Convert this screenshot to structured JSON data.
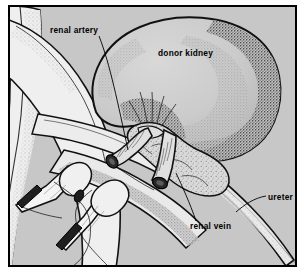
{
  "figure": {
    "kind": "medical-illustration",
    "frame": {
      "border_color": "#000000",
      "background_color": "#c7c7c7",
      "margin_color": "#ffffff"
    },
    "palette": {
      "background": "#c7c7c7",
      "organ_fill": "#cfcfcf",
      "vessel_fill": "#eeeeee",
      "tissue_fill": "#dcdcdc",
      "outline": "#111111",
      "lumen_dark": "#2b2b2b",
      "stipple": "#4a4a4a",
      "label_text": "#000000"
    }
  },
  "labels": [
    {
      "id": "renal-artery",
      "text": "renal artery",
      "x": 50,
      "y": 33,
      "anchor": "start",
      "leader": "M 99,36 C 110,64 118,104 128,150"
    },
    {
      "id": "donor-kidney",
      "text": "donor kidney",
      "x": 158,
      "y": 56,
      "anchor": "start",
      "leader": ""
    },
    {
      "id": "ureter",
      "text": "ureter",
      "x": 268,
      "y": 200,
      "anchor": "start",
      "leader": "M 266,196 C 254,198 244,205 236,212"
    },
    {
      "id": "renal-vein",
      "text": "renal vein",
      "x": 190,
      "y": 229,
      "anchor": "start",
      "leader": "M 196,221 C 190,203 182,186 176,173"
    }
  ],
  "structures": [
    {
      "id": "donor-kidney",
      "name": "donor kidney"
    },
    {
      "id": "renal-artery-stump",
      "name": "renal artery stump"
    },
    {
      "id": "renal-vein-stump",
      "name": "renal vein stump"
    },
    {
      "id": "ureter",
      "name": "ureter"
    },
    {
      "id": "hilar-fat",
      "name": "hilar fat"
    },
    {
      "id": "aorta",
      "name": "great vessel (left, vertical)"
    },
    {
      "id": "vena-cava",
      "name": "great vessel (left, oblique)"
    },
    {
      "id": "vascular-clamp-upper",
      "name": "upper vascular clamp"
    },
    {
      "id": "vascular-clamp-lower",
      "name": "lower vascular clamp"
    },
    {
      "id": "suture-thread",
      "name": "suture thread"
    }
  ]
}
